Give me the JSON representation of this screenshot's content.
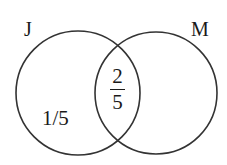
{
  "diagram": {
    "type": "venn",
    "stroke_color": "#333333",
    "background_color": "#ffffff",
    "sets": [
      {
        "id": "J",
        "label": "J",
        "cx": 78,
        "cy": 93,
        "r": 62
      },
      {
        "id": "M",
        "label": "M",
        "cx": 156,
        "cy": 93,
        "r": 61
      }
    ],
    "regions": {
      "j_only": {
        "text": "1/5"
      },
      "intersection": {
        "numerator": "2",
        "denominator": "5"
      },
      "m_only": {
        "text": ""
      }
    }
  }
}
